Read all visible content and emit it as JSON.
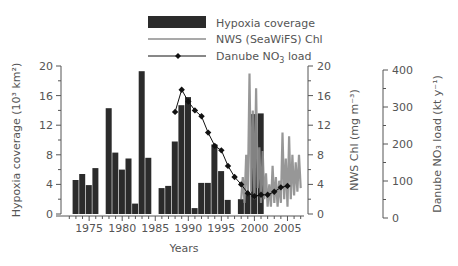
{
  "chart_data": {
    "type": "bar",
    "title": "",
    "xlabel": "Years",
    "x_ticks": [
      1975,
      1980,
      1985,
      1990,
      1995,
      2000,
      2005
    ],
    "x_range": [
      1971.5,
      2007.5
    ],
    "axes": {
      "left": {
        "label": "Hypoxia coverage (10³ km²)",
        "ylim": [
          0,
          20
        ],
        "ticks": [
          0,
          4,
          8,
          12,
          16,
          20
        ]
      },
      "right1": {
        "label": "NWS Chl (mg m⁻³)",
        "ylim": [
          0,
          20
        ],
        "ticks": [
          0,
          4,
          8,
          12,
          16,
          20
        ]
      },
      "right2": {
        "label": "Danube NO₃ load (kt y⁻¹)",
        "ylim": [
          0,
          400
        ],
        "ticks": [
          0,
          100,
          200,
          300,
          400
        ]
      }
    },
    "legend": [
      {
        "label": "Hypoxia coverage",
        "kind": "bar",
        "color": "#2b2b2b"
      },
      {
        "label": "NWS (SeaWiFS) Chl",
        "kind": "line",
        "color": "#8c8c8c"
      },
      {
        "label": "Danube NO3 load",
        "kind": "line-marker",
        "color": "#111111"
      }
    ],
    "series": [
      {
        "name": "Hypoxia coverage",
        "type": "bar",
        "axis": "left",
        "x": [
          1973,
          1974,
          1975,
          1976,
          1978,
          1979,
          1980,
          1981,
          1982,
          1983,
          1984,
          1986,
          1987,
          1988,
          1989,
          1990,
          1991,
          1992,
          1993,
          1994,
          1995,
          1996,
          1998,
          1999,
          2000,
          2001
        ],
        "values": [
          4.6,
          5.4,
          3.9,
          6.2,
          14.3,
          8.3,
          6.0,
          7.5,
          1.4,
          19.3,
          7.6,
          3.5,
          3.8,
          9.8,
          14.7,
          15.8,
          0.8,
          4.2,
          4.2,
          9.4,
          5.8,
          1.9,
          2.0,
          2.8,
          13.5,
          13.6
        ]
      },
      {
        "name": "NWS (SeaWiFS) Chl",
        "type": "line",
        "axis": "right1",
        "x": [
          1998.0,
          1998.25,
          1998.5,
          1998.75,
          1999.0,
          1999.25,
          1999.5,
          1999.75,
          2000.0,
          2000.25,
          2000.5,
          2000.75,
          2001.0,
          2001.25,
          2001.5,
          2001.75,
          2002.0,
          2002.25,
          2002.5,
          2002.75,
          2003.0,
          2003.25,
          2003.5,
          2003.75,
          2004.0,
          2004.25,
          2004.5,
          2004.75,
          2005.0,
          2005.25,
          2005.5,
          2005.75,
          2006.0,
          2006.25,
          2006.5,
          2006.75,
          2007.0
        ],
        "values": [
          2.0,
          5.0,
          1.5,
          8.0,
          2.5,
          19.0,
          3.0,
          14.0,
          2.0,
          17.0,
          3.5,
          9.0,
          1.5,
          8.5,
          2.0,
          5.5,
          1.0,
          4.0,
          1.0,
          6.5,
          1.5,
          5.0,
          1.0,
          4.5,
          1.5,
          11.0,
          2.0,
          7.5,
          1.0,
          10.5,
          2.0,
          8.0,
          2.5,
          7.0,
          3.0,
          8.0,
          3.5
        ]
      },
      {
        "name": "Danube NO3 load",
        "type": "line",
        "axis": "right2",
        "x": [
          1988,
          1989,
          1990,
          1991,
          1992,
          1993,
          1994,
          1995,
          1996,
          1997,
          1998,
          1999,
          2000,
          2001,
          2002,
          2003,
          2004,
          2005
        ],
        "values": [
          276,
          336,
          304,
          280,
          264,
          220,
          184,
          172,
          130,
          100,
          80,
          56,
          48,
          52,
          52,
          60,
          72,
          76
        ]
      }
    ],
    "grid": false,
    "legend_position": "top-center"
  }
}
